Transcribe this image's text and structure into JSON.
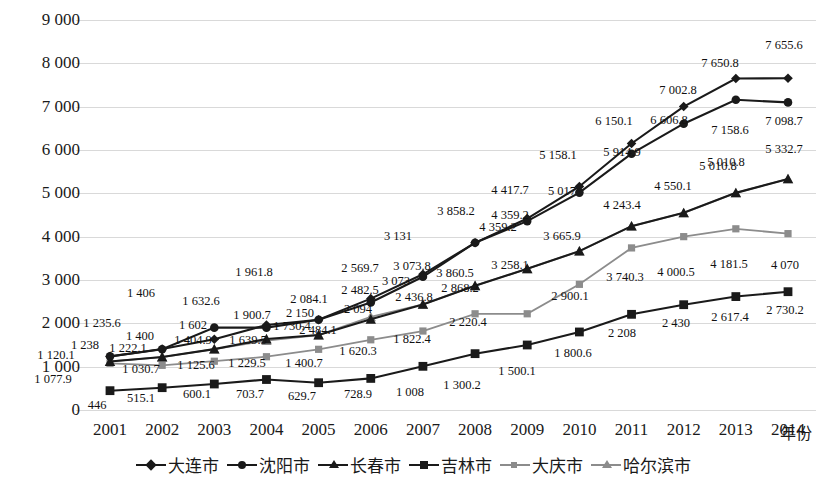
{
  "chart_data": {
    "type": "line",
    "title": "",
    "xlabel": "年份",
    "ylabel": "",
    "ylim": [
      0,
      9000
    ],
    "ytick_step": 1000,
    "grid": true,
    "legend_position": "bottom",
    "categories": [
      "2001",
      "2002",
      "2003",
      "2004",
      "2005",
      "2006",
      "2007",
      "2008",
      "2009",
      "2010",
      "2011",
      "2012",
      "2013",
      "2014"
    ],
    "ytick_labels": [
      "9 000",
      "8 000",
      "7 000",
      "6 000",
      "5 000",
      "4 000",
      "3 000",
      "2 000",
      "1 000",
      "0"
    ],
    "ytick_values": [
      9000,
      8000,
      7000,
      6000,
      5000,
      4000,
      3000,
      2000,
      1000,
      0
    ],
    "series": [
      {
        "name": "大连市",
        "marker": "diamond",
        "color": "#1a1a1a",
        "values": [
          1235.6,
          1406,
          1632.6,
          1961.8,
          2084.1,
          2569.7,
          3131,
          3858.2,
          4417.7,
          5158.1,
          6150.1,
          7002.8,
          7650.8,
          7655.6
        ],
        "labels": [
          "1 235.6",
          "1 406",
          "1 632.6",
          "1 961.8",
          "2 084.1",
          "2 569.7",
          "3 131",
          "3 858.2",
          "4 417.7",
          "5 158.1",
          "6 150.1",
          "7 002.8",
          "7 650.8",
          "7 655.6"
        ]
      },
      {
        "name": "沈阳市",
        "marker": "circle",
        "color": "#1a1a1a",
        "values": [
          1238,
          1400,
          1900.7,
          1900.7,
          2084.1,
          2482.5,
          3073.8,
          3860.5,
          4359.2,
          5017,
          5914.9,
          6606.8,
          7158.6,
          7098.7
        ],
        "labels": [
          "1 238",
          "1 400",
          "1 602",
          "1 900.7",
          "2 084.1",
          "2 482.5",
          "3 073.8",
          "3 860.5",
          "4 359.2",
          "5 017",
          "5 914.9",
          "6 606.8",
          "7 158.6",
          "7 098.7"
        ]
      },
      {
        "name": "长春市",
        "marker": "triangle",
        "color": "#1a1a1a",
        "values": [
          1120.1,
          1222.1,
          1404.9,
          1639.5,
          1730.4,
          2094,
          2436.8,
          2868.2,
          3258.1,
          3665.9,
          4243.4,
          4550.1,
          5010.8,
          5332.7
        ],
        "labels": [
          "1 120.1",
          "1 222.1",
          "1 404.9",
          "1 639.5",
          "1 730.4",
          "2 094",
          "2 436.8",
          "2 868.2",
          "3 258.1",
          "3 665.9",
          "4 243.4",
          "4 550.1",
          "5 010.8",
          "5 332.7"
        ]
      },
      {
        "name": "吉林市",
        "marker": "square",
        "color": "#1a1a1a",
        "values": [
          446,
          515.1,
          600.1,
          703.7,
          629.7,
          728.9,
          1008,
          1300.2,
          1500.1,
          1800.6,
          2208,
          2430,
          2617.4,
          2730.2
        ],
        "labels": [
          "446",
          "515.1",
          "600.1",
          "703.7",
          "629.7",
          "728.9",
          "1 008",
          "1 300.2",
          "1 500.1",
          "1 800.6",
          "2 208",
          "2 430",
          "2 617.4",
          "2 730.2"
        ]
      },
      {
        "name": "大庆市",
        "marker": "square-small",
        "color": "#8c8c8c",
        "values": [
          1077.9,
          1030.7,
          1125.6,
          1229.5,
          1400.7,
          1620.3,
          1822.4,
          2220.4,
          2220.4,
          2900.1,
          3740.3,
          4000.5,
          4181.5,
          4070
        ],
        "labels": [
          "1 077.9",
          "1 030.7",
          "1 125.6",
          "1 229.5",
          "1 400.7",
          "1 620.3",
          "1 822.4",
          "2 220.4",
          "2 220.4",
          "2 900.1",
          "3 740.3",
          "4 000.5",
          "4 181.5",
          "4 070"
        ]
      },
      {
        "name": "哈尔滨市",
        "marker": "triangle",
        "color": "#8c8c8c",
        "values": [
          1120.1,
          1222.1,
          1404.9,
          1602,
          1730.4,
          2150,
          2436.8,
          2868.2,
          3258.1,
          3665.9,
          4243.4,
          4550.1,
          5010.8,
          5332.7
        ],
        "labels": [
          "1 120.1",
          "1 222.1",
          "1 404.9",
          "1 602",
          "1 730.4",
          "2 150",
          "2 436.8",
          "2 868.2",
          "3 258.1",
          "3 665.9",
          "4 243.4",
          "4 550.1",
          "5 010.8",
          "5 332.7"
        ]
      }
    ]
  },
  "axis": {
    "y_ticks": [
      {
        "label": "9 000",
        "value": 9000
      },
      {
        "label": "8 000",
        "value": 8000
      },
      {
        "label": "7 000",
        "value": 7000
      },
      {
        "label": "6 000",
        "value": 6000
      },
      {
        "label": "5 000",
        "value": 5000
      },
      {
        "label": "4 000",
        "value": 4000
      },
      {
        "label": "3 000",
        "value": 3000
      },
      {
        "label": "2 000",
        "value": 2000
      },
      {
        "label": "1 000",
        "value": 1000
      },
      {
        "label": "0",
        "value": 0
      }
    ],
    "x_ticks": [
      "2001",
      "2002",
      "2003",
      "2004",
      "2005",
      "2006",
      "2007",
      "2008",
      "2009",
      "2010",
      "2011",
      "2012",
      "2013",
      "2014"
    ],
    "x_title": "年份"
  },
  "legend": {
    "items": [
      {
        "label": "大连市",
        "marker": "diamond",
        "color": "#1a1a1a"
      },
      {
        "label": "沈阳市",
        "marker": "circle",
        "color": "#1a1a1a"
      },
      {
        "label": "长春市",
        "marker": "triangle",
        "color": "#1a1a1a"
      },
      {
        "label": "吉林市",
        "marker": "square",
        "color": "#1a1a1a"
      },
      {
        "label": "大庆市",
        "marker": "square-small",
        "color": "#8c8c8c"
      },
      {
        "label": "哈尔滨市",
        "marker": "triangle",
        "color": "#8c8c8c"
      }
    ]
  },
  "data_labels": [
    {
      "text": "1 235.6",
      "x": 102,
      "y": 323
    },
    {
      "text": "1 406",
      "x": 141,
      "y": 293
    },
    {
      "text": "1 632.6",
      "x": 201,
      "y": 301
    },
    {
      "text": "1 961.8",
      "x": 254,
      "y": 272
    },
    {
      "text": "2 084.1",
      "x": 309,
      "y": 299
    },
    {
      "text": "2 569.7",
      "x": 360,
      "y": 268
    },
    {
      "text": "3 131",
      "x": 398,
      "y": 236
    },
    {
      "text": "3 858.2",
      "x": 456,
      "y": 211
    },
    {
      "text": "4 417.7",
      "x": 510,
      "y": 190
    },
    {
      "text": "5 158.1",
      "x": 558,
      "y": 155
    },
    {
      "text": "6 150.1",
      "x": 614,
      "y": 121
    },
    {
      "text": "7 002.8",
      "x": 678,
      "y": 90
    },
    {
      "text": "7 650.8",
      "x": 720,
      "y": 63
    },
    {
      "text": "7 655.6",
      "x": 784,
      "y": 45
    },
    {
      "text": "1 238",
      "x": 85,
      "y": 345
    },
    {
      "text": "1 400",
      "x": 140,
      "y": 336
    },
    {
      "text": "1 602",
      "x": 193,
      "y": 325
    },
    {
      "text": "1 900.7",
      "x": 252,
      "y": 315
    },
    {
      "text": "2 484.1",
      "x": 318,
      "y": 330
    },
    {
      "text": "2 482.5",
      "x": 360,
      "y": 290
    },
    {
      "text": "3 073.8",
      "x": 412,
      "y": 266
    },
    {
      "text": "3 860.5",
      "x": 455,
      "y": 273
    },
    {
      "text": "4 359.2",
      "x": 510,
      "y": 215
    },
    {
      "text": "5 017",
      "x": 562,
      "y": 191
    },
    {
      "text": "5 914.9",
      "x": 622,
      "y": 152
    },
    {
      "text": "6 606.8",
      "x": 669,
      "y": 120
    },
    {
      "text": "7 158.6",
      "x": 730,
      "y": 130
    },
    {
      "text": "7 098.7",
      "x": 784,
      "y": 121
    },
    {
      "text": "1 120.1",
      "x": 56,
      "y": 355
    },
    {
      "text": "1 222.1",
      "x": 128,
      "y": 348
    },
    {
      "text": "1 404.9",
      "x": 193,
      "y": 340
    },
    {
      "text": "1 639.5",
      "x": 248,
      "y": 340
    },
    {
      "text": "1 730.4",
      "x": 292,
      "y": 326
    },
    {
      "text": "2 094",
      "x": 358,
      "y": 309
    },
    {
      "text": "2 436.8",
      "x": 414,
      "y": 297
    },
    {
      "text": "2 868.2",
      "x": 460,
      "y": 288
    },
    {
      "text": "3 258.1",
      "x": 510,
      "y": 265
    },
    {
      "text": "3 665.9",
      "x": 562,
      "y": 236
    },
    {
      "text": "4 243.4",
      "x": 622,
      "y": 205
    },
    {
      "text": "4 550.1",
      "x": 673,
      "y": 186
    },
    {
      "text": "5 010.8",
      "x": 726,
      "y": 162
    },
    {
      "text": "5 332.7",
      "x": 784,
      "y": 149
    },
    {
      "text": "446",
      "x": 97,
      "y": 405
    },
    {
      "text": "515.1",
      "x": 141,
      "y": 398
    },
    {
      "text": "600.1",
      "x": 197,
      "y": 394
    },
    {
      "text": "703.7",
      "x": 250,
      "y": 394
    },
    {
      "text": "629.7",
      "x": 302,
      "y": 396
    },
    {
      "text": "728.9",
      "x": 358,
      "y": 394
    },
    {
      "text": "1 008",
      "x": 410,
      "y": 392
    },
    {
      "text": "1 300.2",
      "x": 462,
      "y": 385
    },
    {
      "text": "1 500.1",
      "x": 517,
      "y": 371
    },
    {
      "text": "1 800.6",
      "x": 573,
      "y": 353
    },
    {
      "text": "2 208",
      "x": 622,
      "y": 333
    },
    {
      "text": "2 430",
      "x": 676,
      "y": 323
    },
    {
      "text": "2 617.4",
      "x": 730,
      "y": 317
    },
    {
      "text": "2 730.2",
      "x": 785,
      "y": 310
    },
    {
      "text": "1 077.9",
      "x": 53,
      "y": 379
    },
    {
      "text": "1 030.7",
      "x": 141,
      "y": 369
    },
    {
      "text": "1 125.6",
      "x": 196,
      "y": 365
    },
    {
      "text": "1 229.5",
      "x": 247,
      "y": 363
    },
    {
      "text": "1 400.7",
      "x": 304,
      "y": 363
    },
    {
      "text": "1 620.3",
      "x": 358,
      "y": 351
    },
    {
      "text": "1 822.4",
      "x": 412,
      "y": 339
    },
    {
      "text": "2 220.4",
      "x": 468,
      "y": 322
    },
    {
      "text": "2 900.1",
      "x": 570,
      "y": 296
    },
    {
      "text": "3 740.3",
      "x": 625,
      "y": 277
    },
    {
      "text": "4 000.5",
      "x": 676,
      "y": 272
    },
    {
      "text": "4 181.5",
      "x": 729,
      "y": 264
    },
    {
      "text": "4 070",
      "x": 785,
      "y": 265
    },
    {
      "text": "2 150",
      "x": 300,
      "y": 313
    },
    {
      "text": "3 073",
      "x": 396,
      "y": 281
    },
    {
      "text": "4 359.2",
      "x": 498,
      "y": 227
    },
    {
      "text": "5 010.8",
      "x": 718,
      "y": 166
    }
  ]
}
